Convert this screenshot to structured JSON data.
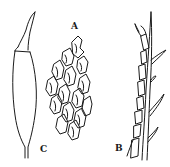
{
  "figure": {
    "type": "botanical line illustration",
    "ink_color": "#1a1a1a",
    "background": "#ffffff",
    "panels": [
      {
        "id": "A",
        "label": "A",
        "subject": "leaf cells (areolation) cluster"
      },
      {
        "id": "B",
        "label": "B",
        "subject": "branch / stem portion with leaves"
      },
      {
        "id": "C",
        "label": "C",
        "subject": "capsule with beaked operculum"
      }
    ]
  }
}
